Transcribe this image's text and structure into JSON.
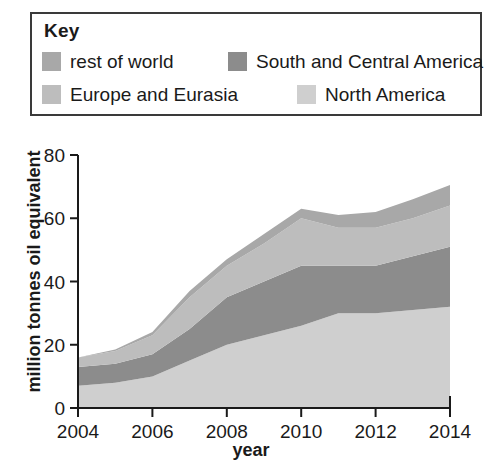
{
  "legend": {
    "title": "Key",
    "items": [
      {
        "label": "rest of world",
        "color": "#a8a8a8",
        "row": 1,
        "col": 1
      },
      {
        "label": "South and Central America",
        "color": "#8c8c8c",
        "row": 1,
        "col": 2
      },
      {
        "label": "Europe and Eurasia",
        "color": "#bdbdbd",
        "row": 2,
        "col": 1
      },
      {
        "label": "North America",
        "color": "#cfcfcf",
        "row": 2,
        "col": 2
      }
    ]
  },
  "chart_data": {
    "type": "area",
    "stacked": true,
    "title": "",
    "xlabel": "year",
    "ylabel": "million tonnes oil equivalent",
    "xlim": [
      2004,
      2014
    ],
    "ylim": [
      0,
      80
    ],
    "xticks": [
      2004,
      2006,
      2008,
      2010,
      2012,
      2014
    ],
    "yticks": [
      0,
      20,
      40,
      60,
      80
    ],
    "grid": false,
    "legend_position": "top",
    "x": [
      2004,
      2005,
      2006,
      2007,
      2008,
      2009,
      2010,
      2011,
      2012,
      2013,
      2014
    ],
    "series": [
      {
        "name": "North America",
        "color": "#cfcfcf",
        "values": [
          7,
          8,
          10,
          15,
          20,
          23,
          26,
          30,
          30,
          31,
          32
        ]
      },
      {
        "name": "South and Central America",
        "color": "#8c8c8c",
        "values": [
          6,
          6,
          7,
          10,
          15,
          17,
          19,
          15,
          15,
          17,
          19
        ]
      },
      {
        "name": "Europe and Eurasia",
        "color": "#bdbdbd",
        "values": [
          3,
          4,
          6,
          10,
          10,
          12,
          15,
          12,
          12,
          12,
          13
        ]
      },
      {
        "name": "rest of world",
        "color": "#a8a8a8",
        "values": [
          0,
          0.5,
          1,
          2,
          2,
          3,
          3,
          4,
          5,
          6,
          6.5
        ]
      }
    ],
    "cumulative": {
      "north_america": [
        7,
        8,
        10,
        15,
        20,
        23,
        26,
        30,
        30,
        31,
        32
      ],
      "south_central_america": [
        13,
        14,
        17,
        25,
        35,
        40,
        45,
        45,
        45,
        48,
        51
      ],
      "europe_eurasia": [
        16,
        18,
        23,
        35,
        45,
        52,
        60,
        57,
        57,
        60,
        64
      ],
      "rest_of_world": [
        16,
        18.5,
        24,
        37,
        47,
        55,
        63,
        61,
        62,
        66,
        70.5
      ]
    }
  },
  "axis": {
    "y_tick_labels": [
      "80",
      "60",
      "40",
      "20",
      "0"
    ],
    "x_tick_labels": [
      "2004",
      "2006",
      "2008",
      "2010",
      "2012",
      "2014"
    ],
    "y_title": "million tonnes oil equivalent",
    "x_title": "year"
  }
}
